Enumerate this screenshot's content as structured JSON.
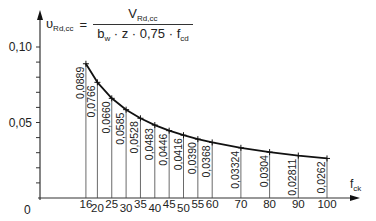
{
  "formula": {
    "lhs": "υ",
    "lhs_sub": "Rd,cc",
    "equals": "=",
    "numerator": "V",
    "numerator_sub": "Rd,cc",
    "denominator_parts": [
      "b",
      "w",
      " · z · 0,75 · f",
      "cd"
    ]
  },
  "chart_data": {
    "type": "line",
    "xlabel": "fck",
    "ylabel": "υRd,cc",
    "x": [
      16,
      20,
      25,
      30,
      35,
      40,
      45,
      50,
      55,
      60,
      70,
      80,
      90,
      100
    ],
    "values": [
      0.0889,
      0.0766,
      0.066,
      0.0585,
      0.0528,
      0.0483,
      0.0446,
      0.0416,
      0.039,
      0.0368,
      0.03324,
      0.0304,
      0.02811,
      0.0262
    ],
    "data_labels": [
      "0,0889",
      "0,0766",
      "0,0660",
      "0,0585",
      "0,0528",
      "0,0483",
      "0,0446",
      "0,0416",
      "0,0390",
      "0,0368",
      "0,03324",
      "0,0304",
      "0,02811",
      "0,0262"
    ],
    "x_tick_labels": [
      "16",
      "20",
      "25",
      "30",
      "35",
      "40",
      "45",
      "50",
      "55",
      "60",
      "70",
      "80",
      "90",
      "100"
    ],
    "y_tick_labels": [
      "0",
      "0,05",
      "0,10"
    ],
    "y_ticks": [
      0,
      0.05,
      0.1
    ],
    "y_minor_step": 0.01,
    "origin_label": "0",
    "ylim": [
      0,
      0.11
    ],
    "xlim": [
      0,
      105
    ],
    "grid": false,
    "legend": null
  }
}
